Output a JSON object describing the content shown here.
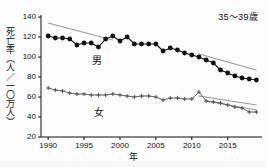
{
  "chart_data": {
    "type": "line",
    "title": "",
    "annotation": "35〜39歳",
    "xlabel": "年",
    "ylabel": "死亡率（人／一〇万人）",
    "xlim": [
      1989,
      2019.5
    ],
    "ylim": [
      20,
      140
    ],
    "xticks": [
      1990,
      1995,
      2000,
      2005,
      2010,
      2015
    ],
    "yticks": [
      20,
      40,
      60,
      80,
      100,
      120,
      140
    ],
    "grid": false,
    "legend_position": "inline-annotations",
    "x": [
      1990,
      1991,
      1992,
      1993,
      1994,
      1995,
      1996,
      1997,
      1998,
      1999,
      2000,
      2001,
      2002,
      2003,
      2004,
      2005,
      2006,
      2007,
      2008,
      2009,
      2010,
      2011,
      2012,
      2013,
      2014,
      2015,
      2016,
      2017,
      2018,
      2019
    ],
    "series": [
      {
        "name": "男",
        "marker": "filled-circle",
        "color": "#111111",
        "values": [
          121,
          119,
          119,
          118,
          112,
          114,
          114,
          110,
          118,
          121,
          116,
          120,
          113,
          113,
          113,
          113,
          106,
          109,
          107,
          104,
          102,
          100,
          97,
          94,
          87,
          84,
          81,
          79,
          78,
          77
        ]
      },
      {
        "name": "女",
        "marker": "plus",
        "color": "#555555",
        "values": [
          69,
          67,
          66,
          64,
          63,
          63,
          62,
          62,
          62,
          63,
          62,
          61,
          60,
          61,
          61,
          60,
          57,
          59,
          59,
          58,
          58,
          65,
          56,
          55,
          54,
          52,
          50,
          49,
          45,
          45
        ]
      }
    ],
    "trend_lines": [
      {
        "name": "male-trend-early",
        "x0": 1990,
        "y0": 134,
        "x1": 1999,
        "y1": 117
      },
      {
        "name": "male-trend-late",
        "x0": 2011,
        "y0": 103,
        "x1": 2019,
        "y1": 87
      },
      {
        "name": "female-trend-early",
        "x0": 2011,
        "y0": 61,
        "x1": 2019,
        "y1": 52
      },
      {
        "name": "female-trend-late",
        "x0": 2012,
        "y0": 56,
        "x1": 2019,
        "y1": 47
      }
    ]
  }
}
